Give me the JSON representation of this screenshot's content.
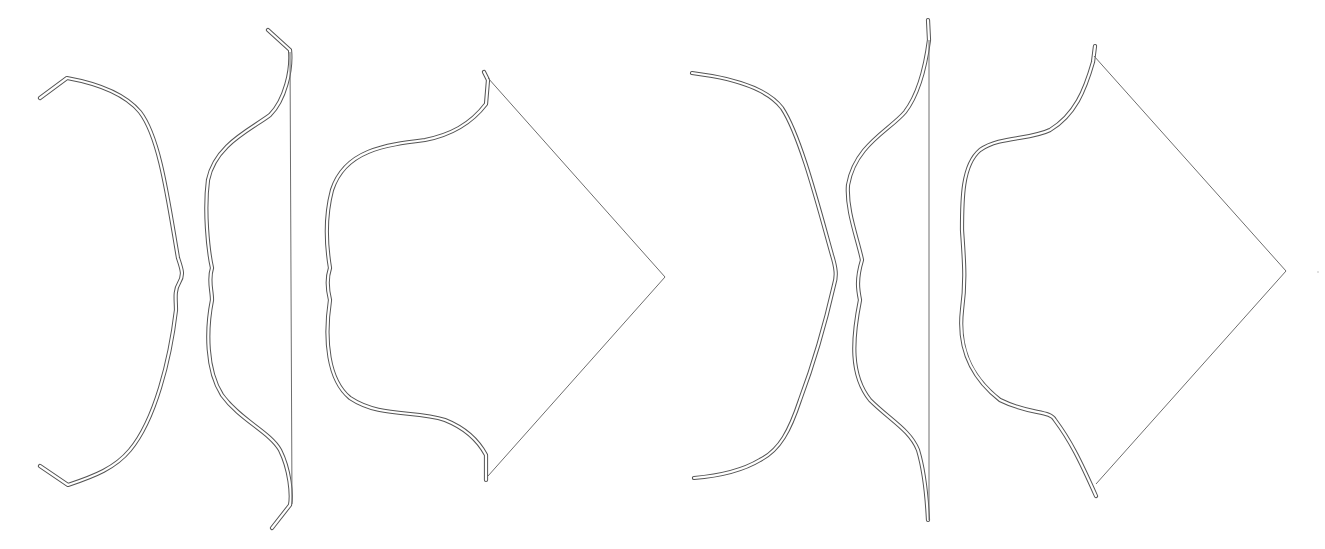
{
  "figure": {
    "colors": {
      "background": "#ffffff",
      "limb_outline": "#555555",
      "string": "#6e6e6e"
    },
    "groups": [
      {
        "name": "left-set",
        "bows": [
          {
            "state": "unstrung",
            "has_string": false
          },
          {
            "state": "braced",
            "has_string": true,
            "string_shape": "straight"
          },
          {
            "state": "full-draw",
            "has_string": true,
            "string_shape": "v"
          }
        ]
      },
      {
        "name": "right-set",
        "bows": [
          {
            "state": "unstrung",
            "has_string": false
          },
          {
            "state": "braced",
            "has_string": true,
            "string_shape": "straight"
          },
          {
            "state": "full-draw",
            "has_string": true,
            "string_shape": "v"
          }
        ]
      }
    ]
  }
}
